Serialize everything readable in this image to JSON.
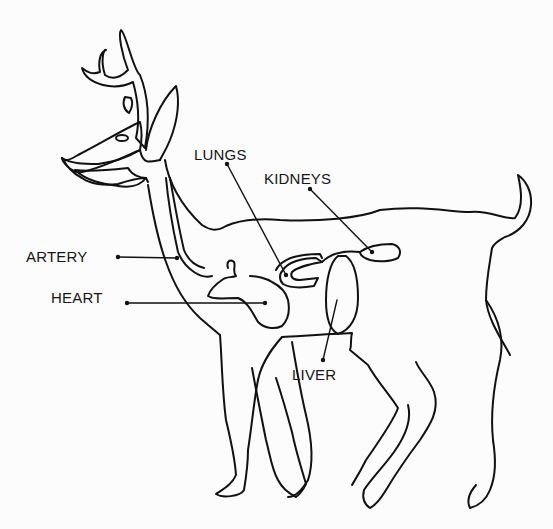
{
  "diagram": {
    "line_color": "#111111",
    "background": "#fcfcfc",
    "labels": [
      {
        "id": "lungs",
        "text": "LUNGS",
        "x": 194,
        "y": 147
      },
      {
        "id": "kidneys",
        "text": "KIDNEYS",
        "x": 264,
        "y": 171
      },
      {
        "id": "artery",
        "text": "ARTERY",
        "x": 26,
        "y": 249
      },
      {
        "id": "heart",
        "text": "HEART",
        "x": 51,
        "y": 290
      },
      {
        "id": "liver",
        "text": "LIVER",
        "x": 292,
        "y": 367
      }
    ]
  }
}
